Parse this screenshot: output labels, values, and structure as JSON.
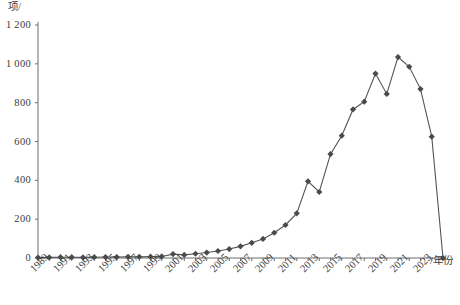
{
  "chart_data": {
    "type": "line",
    "title": "",
    "subtitle": "",
    "xlabel": "/年份",
    "ylabel": "项/",
    "xlim": [
      1989,
      2025
    ],
    "ylim": [
      0,
      1200
    ],
    "grid": false,
    "legend": "none",
    "marker": "diamond",
    "line_color": "#555555",
    "marker_color": "#4a4a4a",
    "axis_color": "#6e6e6e",
    "y_ticks": [
      "0",
      "200",
      "400",
      "600",
      "800",
      "1 000",
      "1 200"
    ],
    "y_tick_values": [
      0,
      200,
      400,
      600,
      800,
      1000,
      1200
    ],
    "x_ticks": [
      "1989",
      "1991",
      "1993",
      "1995",
      "1997",
      "1999",
      "2001",
      "2003",
      "2005",
      "2007",
      "2009",
      "2011",
      "2013",
      "2015",
      "2017",
      "2019",
      "2021",
      "2023"
    ],
    "x_tick_values": [
      1989,
      1991,
      1993,
      1995,
      1997,
      1999,
      2001,
      2003,
      2005,
      2007,
      2009,
      2011,
      2013,
      2015,
      2017,
      2019,
      2021,
      2023
    ],
    "x": [
      1989,
      1990,
      1991,
      1992,
      1993,
      1994,
      1995,
      1996,
      1997,
      1998,
      1999,
      2000,
      2001,
      2002,
      2003,
      2004,
      2005,
      2006,
      2007,
      2008,
      2009,
      2010,
      2011,
      2012,
      2013,
      2014,
      2015,
      2016,
      2017,
      2018,
      2019,
      2020,
      2021,
      2022,
      2023,
      2024,
      2025
    ],
    "values": [
      2,
      3,
      4,
      4,
      3,
      4,
      5,
      5,
      6,
      6,
      7,
      8,
      20,
      16,
      22,
      28,
      36,
      46,
      60,
      78,
      98,
      130,
      170,
      230,
      395,
      340,
      535,
      630,
      765,
      805,
      950,
      845,
      1035,
      985,
      870,
      625,
      0
    ],
    "annotations": []
  }
}
